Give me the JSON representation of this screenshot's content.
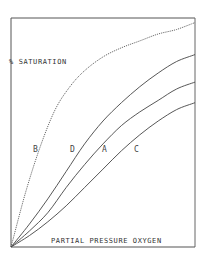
{
  "chart_data": {
    "type": "line",
    "title": "",
    "xlabel": "PARTIAL PRESSURE OXYGEN",
    "ylabel": "% SATURATION",
    "xlim": [
      0,
      100
    ],
    "ylim": [
      0,
      100
    ],
    "grid": false,
    "legend": "inline curve labels",
    "series": [
      {
        "name": "B",
        "style": "dotted",
        "x": [
          0,
          8,
          16,
          24,
          32,
          40,
          50,
          60,
          70,
          80,
          90,
          100
        ],
        "y": [
          0,
          24,
          44,
          60,
          70,
          77,
          83,
          87,
          90,
          93,
          95,
          98
        ]
      },
      {
        "name": "D",
        "style": "solid",
        "x": [
          0,
          10,
          20,
          30,
          40,
          50,
          60,
          70,
          80,
          90,
          100
        ],
        "y": [
          0,
          10,
          21,
          33,
          45,
          55,
          63,
          70,
          76,
          81,
          84
        ]
      },
      {
        "name": "A",
        "style": "solid",
        "x": [
          0,
          10,
          20,
          30,
          40,
          50,
          60,
          70,
          80,
          90,
          100
        ],
        "y": [
          0,
          7,
          15,
          26,
          36,
          45,
          53,
          59,
          64,
          69,
          72
        ]
      },
      {
        "name": "C",
        "style": "solid",
        "x": [
          0,
          10,
          20,
          30,
          40,
          50,
          60,
          70,
          80,
          90,
          100
        ],
        "y": [
          0,
          5,
          11,
          18,
          26,
          34,
          42,
          49,
          55,
          60,
          63
        ]
      }
    ],
    "annotations": [
      {
        "text": "B",
        "x": 13,
        "y": 43
      },
      {
        "text": "D",
        "x": 34,
        "y": 43
      },
      {
        "text": "A",
        "x": 49,
        "y": 43
      },
      {
        "text": "C",
        "x": 67,
        "y": 43
      }
    ]
  },
  "labels": {
    "y_axis": "% SATURATION",
    "x_axis": "PARTIAL PRESSURE OXYGEN",
    "curve_b": "B",
    "curve_d": "D",
    "curve_a": "A",
    "curve_c": "C"
  },
  "colors": {
    "axis": "#555555",
    "line": "#444444",
    "background": "#ffffff"
  }
}
